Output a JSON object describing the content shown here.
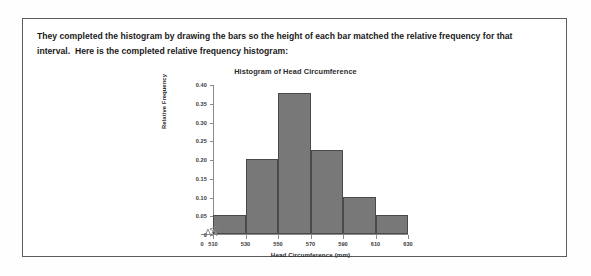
{
  "document": {
    "paragraph_lines": [
      "They completed the histogram by drawing the bars so the height of each bar matched the relative frequency for that",
      "interval.  Here is the completed relative frequency histogram:"
    ]
  },
  "chart_data": {
    "type": "bar",
    "title": "Histogram of Head Circumference",
    "xlabel": "Head Circumference (mm)",
    "ylabel": "Relative Frequency",
    "categories": [
      "510-530",
      "530-550",
      "550-570",
      "570-590",
      "590-610",
      "610-630"
    ],
    "bin_edges": [
      510,
      530,
      550,
      570,
      590,
      610,
      630
    ],
    "values": [
      0.05,
      0.2,
      0.375,
      0.225,
      0.1,
      0.05
    ],
    "xlim": [
      510,
      630
    ],
    "ylim": [
      0,
      0.4
    ],
    "x_ticks": [
      "510",
      "530",
      "550",
      "570",
      "590",
      "610",
      "630"
    ],
    "x_tick_values": [
      510,
      530,
      550,
      570,
      590,
      610,
      630
    ],
    "y_ticks": [
      "0",
      "0.05",
      "0.10",
      "0.15",
      "0.20",
      "0.25",
      "0.30",
      "0.35",
      "0.40"
    ],
    "y_tick_values": [
      0,
      0.05,
      0.1,
      0.15,
      0.2,
      0.25,
      0.3,
      0.35,
      0.4
    ],
    "origin_label": "0",
    "grid": false,
    "legend": null,
    "axis_break_x": true,
    "axis_break_y": true,
    "bar_fill_color": "#787878",
    "bar_edge_color": "#4a4a4a",
    "axis_color": "#8a8a8a"
  }
}
